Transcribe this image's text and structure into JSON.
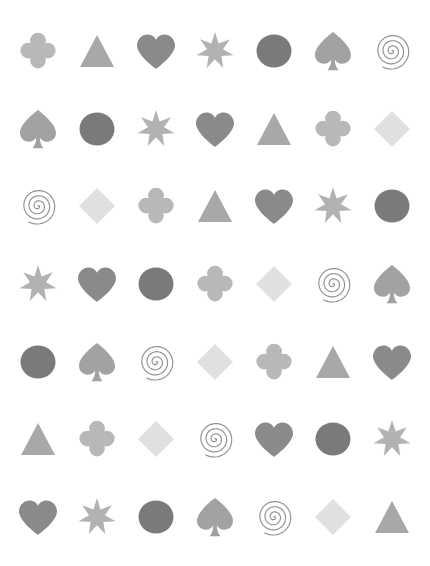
{
  "canvas": {
    "width": 430,
    "height": 566,
    "background": "#ffffff",
    "columns": 7,
    "rows": 7,
    "description": "grid of grayscale symbol glyphs"
  },
  "palette": {
    "circle": "#7a7a7a",
    "heart": "#8a8a8a",
    "spade": "#a2a2a2",
    "triangle": "#a8a8a8",
    "star": "#b2b2b2",
    "club": "#b8b8b8",
    "diamond": "#e0e0e0",
    "spiral": "#909090",
    "background": "#ffffff"
  },
  "shape_names": {
    "club": "club",
    "triangle": "triangle",
    "heart": "heart",
    "star": "seven-point-star",
    "circle": "circle",
    "spade": "spade",
    "spiral": "spiral",
    "diamond": "diamond"
  },
  "grid": [
    [
      "club",
      "triangle",
      "heart",
      "star",
      "circle",
      "spade",
      "spiral"
    ],
    [
      "spade",
      "circle",
      "star",
      "heart",
      "triangle",
      "club",
      "diamond"
    ],
    [
      "spiral",
      "diamond",
      "club",
      "triangle",
      "heart",
      "star",
      "circle"
    ],
    [
      "star",
      "heart",
      "circle",
      "club",
      "diamond",
      "spiral",
      "spade"
    ],
    [
      "circle",
      "spade",
      "spiral",
      "diamond",
      "club",
      "triangle",
      "heart"
    ],
    [
      "triangle",
      "club",
      "diamond",
      "spiral",
      "heart",
      "circle",
      "star"
    ],
    [
      "heart",
      "star",
      "circle",
      "spade",
      "spiral",
      "diamond",
      "triangle"
    ]
  ],
  "counts": {
    "club": 7,
    "triangle": 7,
    "heart": 7,
    "star": 7,
    "circle": 7,
    "spade": 7,
    "spiral": 7,
    "diamond": 7
  }
}
